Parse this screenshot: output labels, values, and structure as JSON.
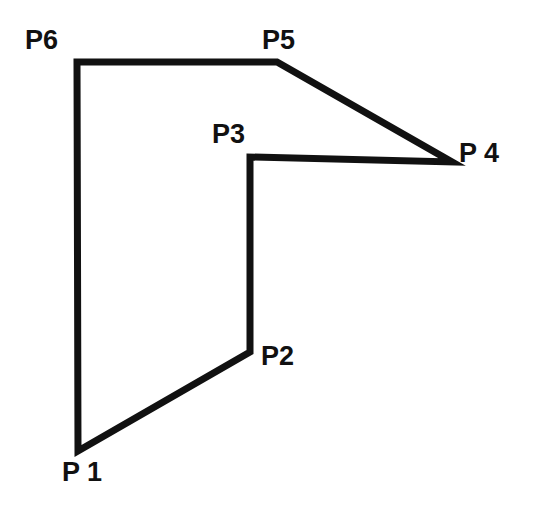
{
  "figure": {
    "background_color": "#ffffff",
    "stroke_color": "#111111",
    "stroke_width": 7,
    "label_color": "#111111",
    "canvas": {
      "width": 533,
      "height": 507
    }
  },
  "polygon": {
    "closed": true,
    "points_attr": "78,451 250,352 250,157 452,162 277,62 77,62",
    "vertices": [
      {
        "id": "P1",
        "label": "P 1",
        "x": 78,
        "y": 451,
        "label_x": 62,
        "label_y": 459
      },
      {
        "id": "P2",
        "label": "P2",
        "x": 250,
        "y": 352,
        "label_x": 261,
        "label_y": 343
      },
      {
        "id": "P3",
        "label": "P3",
        "x": 250,
        "y": 157,
        "label_x": 212,
        "label_y": 121
      },
      {
        "id": "P4",
        "label": "P 4",
        "x": 452,
        "y": 162,
        "label_x": 459,
        "label_y": 140
      },
      {
        "id": "P5",
        "label": "P5",
        "x": 277,
        "y": 62,
        "label_x": 262,
        "label_y": 27
      },
      {
        "id": "P6",
        "label": "P6",
        "x": 77,
        "y": 62,
        "label_x": 25,
        "label_y": 27
      }
    ]
  }
}
